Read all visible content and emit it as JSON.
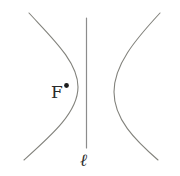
{
  "figure": {
    "type": "hyperbola-with-directrix",
    "labels": {
      "focus": "F",
      "directrix": "ℓ"
    },
    "colors": {
      "background": "#ffffff",
      "curve": "#82827c",
      "line": "#8c8c8c",
      "point": "#1c1c1c",
      "text": "#2b2b2b"
    }
  }
}
